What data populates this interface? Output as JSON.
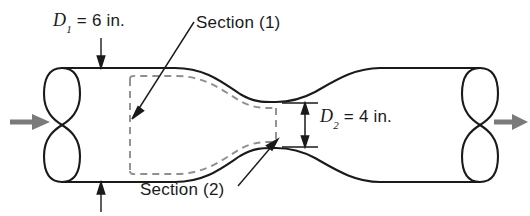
{
  "figure": {
    "type": "engineering-schematic",
    "labels": {
      "d1_symbol": "D",
      "d1_subscript": "1",
      "d1_value": " = 6 in.",
      "d1_full": "D1 = 6 in.",
      "d2_symbol": "D",
      "d2_subscript": "2",
      "d2_value": " = 4 in.",
      "d2_full": "D2 = 4 in.",
      "section1": "Section (1)",
      "section2": "Section (2)"
    },
    "annotations": {
      "inlet_flow_arrow": "flow-in",
      "outlet_flow_arrow": "flow-out",
      "d1_leader_top": "arrow pointing down to upper pipe wall",
      "d1_leader_bottom": "arrow pointing up to lower pipe wall",
      "d2_dimension": "double-headed vertical dimension arrow at throat",
      "section1_leader": "leader line to upstream control surface",
      "section2_leader": "leader line to throat control surface"
    },
    "colors": {
      "outline": "#1a1a1a",
      "dashed_control_volume": "#8c8c8c",
      "flow_arrow": "#7a7a7a",
      "dimension_line": "#1a1a1a",
      "background": "#ffffff",
      "text": "#1a1a1a"
    },
    "geometry": {
      "inlet_diameter_in": 6,
      "throat_diameter_in": 4,
      "inlet_top_y": 68,
      "inlet_bottom_y": 182,
      "throat_top_y": 102,
      "throat_bottom_y": 148,
      "throat_x": 276,
      "pipe_left_x": 62,
      "pipe_right_x": 480,
      "cv_left_x": 130,
      "cv_right_x": 276
    }
  }
}
